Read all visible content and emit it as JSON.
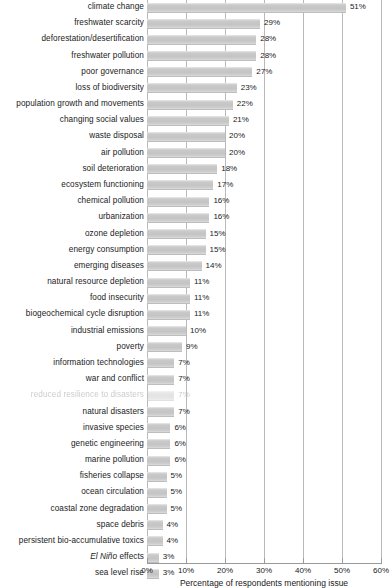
{
  "chart_data": {
    "type": "bar",
    "orientation": "horizontal",
    "title": "",
    "xlabel": "Percentage of respondents mentioning issue",
    "ylabel": "",
    "xlim": [
      0,
      60
    ],
    "xunit": "%",
    "grid": "vertical",
    "legend": "none",
    "xticks": [
      "0%",
      "10%",
      "20%",
      "30%",
      "40%",
      "50%",
      "60%"
    ],
    "xtick_values": [
      0,
      10,
      20,
      30,
      40,
      50,
      60
    ],
    "categories": [
      "climate change",
      "freshwater scarcity",
      "deforestation/desertification",
      "freshwater pollution",
      "poor governance",
      "loss of biodiversity",
      "population growth and movements",
      "changing social values",
      "waste disposal",
      "air pollution",
      "soil deterioration",
      "ecosystem functioning",
      "chemical pollution",
      "urbanization",
      "ozone depletion",
      "energy consumption",
      "emerging diseases",
      "natural resource depletion",
      "food insecurity",
      "biogeochemical cycle disruption",
      "industrial emissions",
      "poverty",
      "information technologies",
      "war and conflict",
      "reduced resilience to disasters",
      "natural disasters",
      "invasive species",
      "genetic engineering",
      "marine pollution",
      "fisheries collapse",
      "ocean circulation",
      "coastal zone degradation",
      "space debris",
      "persistent bio-accumulative toxics",
      "El Niño effects",
      "sea level rise"
    ],
    "values": [
      51,
      29,
      28,
      28,
      27,
      23,
      22,
      21,
      20,
      20,
      18,
      17,
      16,
      16,
      15,
      15,
      14,
      11,
      11,
      11,
      10,
      9,
      7,
      7,
      7,
      7,
      6,
      6,
      6,
      5,
      5,
      5,
      4,
      4,
      3,
      3
    ],
    "value_labels": [
      "51%",
      "29%",
      "28%",
      "28%",
      "27%",
      "23%",
      "22%",
      "21%",
      "20%",
      "20%",
      "18%",
      "17%",
      "16%",
      "16%",
      "15%",
      "15%",
      "14%",
      "11%",
      "11%",
      "11%",
      "10%",
      "9%",
      "7%",
      "7%",
      "7%",
      "7%",
      "6%",
      "6%",
      "6%",
      "5%",
      "5%",
      "5%",
      "4%",
      "4%",
      "3%",
      "3%"
    ],
    "italic_prefix": {
      "34": "El Niño"
    },
    "faded_rows": [
      24
    ],
    "bar_color": "#c8c8c8",
    "gridline_color": "#b9b9b9",
    "text_color": "#1a1a1a"
  }
}
